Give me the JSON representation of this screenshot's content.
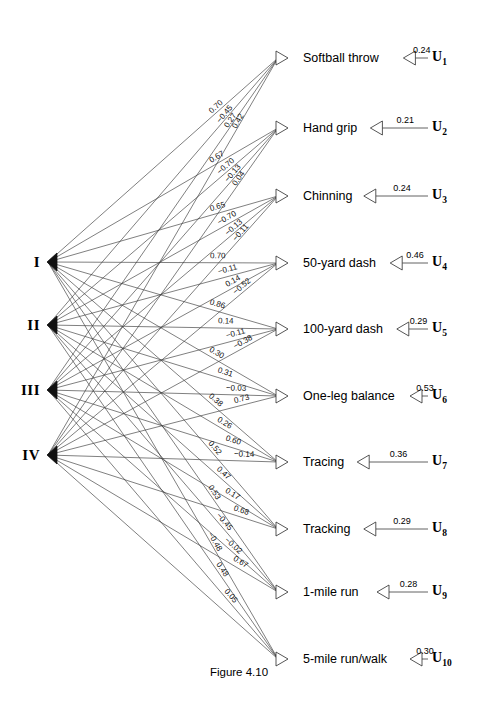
{
  "figure": {
    "caption": "Figure 4.10",
    "type": "path-diagram",
    "title": ""
  },
  "factors": [
    {
      "id": "F1",
      "label": "I",
      "x": 40,
      "y": 262
    },
    {
      "id": "F2",
      "label": "II",
      "x": 40,
      "y": 325
    },
    {
      "id": "F3",
      "label": "III",
      "x": 40,
      "y": 390
    },
    {
      "id": "F4",
      "label": "IV",
      "x": 40,
      "y": 455
    }
  ],
  "variables": [
    {
      "id": "V1",
      "label": "Softball throw",
      "x": 303,
      "y": 58,
      "arrow_x": 288,
      "u": "U",
      "u_sub": "1",
      "u_coef": "0.24",
      "loadings": [
        "0.70",
        "−0.45",
        "0.27",
        "0.42"
      ]
    },
    {
      "id": "V2",
      "label": "Hand grip",
      "x": 303,
      "y": 128,
      "arrow_x": 288,
      "u": "U",
      "u_sub": "2",
      "u_coef": "0.21",
      "loadings": [
        "0.67",
        "−0.70",
        "−0.13",
        "0.04"
      ]
    },
    {
      "id": "V3",
      "label": "Chinning",
      "x": 303,
      "y": 196,
      "arrow_x": 288,
      "u": "U",
      "u_sub": "3",
      "u_coef": "0.24",
      "loadings": [
        "0.65",
        "−0.70",
        "−0.13",
        "−0.11"
      ]
    },
    {
      "id": "V4",
      "label": "50-yard dash",
      "x": 303,
      "y": 263,
      "arrow_x": 288,
      "u": "U",
      "u_sub": "4",
      "u_coef": "0.46",
      "loadings": [
        "0.70",
        "−0.11",
        "0.14",
        "−0.52"
      ]
    },
    {
      "id": "V5",
      "label": "100-yard dash",
      "x": 303,
      "y": 329,
      "arrow_x": 288,
      "u": "U",
      "u_sub": "5",
      "u_coef": "0.29",
      "loadings": [
        "0.86",
        "0.14",
        "−0.11",
        "−0.38"
      ]
    },
    {
      "id": "V6",
      "label": "One-leg balance",
      "x": 303,
      "y": 396,
      "arrow_x": 288,
      "u": "U",
      "u_sub": "6",
      "u_coef": "0.53",
      "loadings": [
        "0.30",
        "0.31",
        "−0.03",
        "0.73"
      ]
    },
    {
      "id": "V7",
      "label": "Tracing",
      "x": 303,
      "y": 462,
      "arrow_x": 288,
      "u": "U",
      "u_sub": "7",
      "u_coef": "0.36",
      "loadings": [
        "0.38",
        "0.26",
        "0.60",
        "−0.14"
      ]
    },
    {
      "id": "V8",
      "label": "Tracking",
      "x": 303,
      "y": 529,
      "arrow_x": 288,
      "u": "U",
      "u_sub": "8",
      "u_coef": "0.29",
      "loadings": [
        "0.52",
        "0.47",
        "0.17",
        "0.68"
      ]
    },
    {
      "id": "V9",
      "label": "1-mile run",
      "x": 303,
      "y": 592,
      "arrow_x": 288,
      "u": "U",
      "u_sub": "9",
      "u_coef": "0.28",
      "loadings": [
        "0.53",
        "−0.45",
        "−0.02",
        "0.67"
      ]
    },
    {
      "id": "V10",
      "label": "5-mile run/walk",
      "x": 303,
      "y": 659,
      "arrow_x": 288,
      "u": "U",
      "u_sub": "10",
      "u_coef": "0.30",
      "loadings": [
        "−0.48",
        "0.48",
        "0.05",
        ""
      ]
    }
  ],
  "chart_data": {
    "type": "diagram",
    "title": "Figure 4.10",
    "factor_names": [
      "I",
      "II",
      "III",
      "IV"
    ],
    "variable_names": [
      "Softball throw",
      "Hand grip",
      "Chinning",
      "50-yard dash",
      "100-yard dash",
      "One-leg balance",
      "Tracing",
      "Tracking",
      "1-mile run",
      "5-mile run/walk"
    ],
    "residual_names": [
      "U1",
      "U2",
      "U3",
      "U4",
      "U5",
      "U6",
      "U7",
      "U8",
      "U9",
      "U10"
    ],
    "residual_coefficients": [
      0.24,
      0.21,
      0.24,
      0.46,
      0.29,
      0.53,
      0.36,
      0.29,
      0.28,
      0.3
    ],
    "loading_labels_by_variable": {
      "Softball throw": [
        "0.70",
        "-0.45",
        "0.27",
        "0.42"
      ],
      "Hand grip": [
        "0.67",
        "-0.70",
        "-0.13",
        "0.04"
      ],
      "Chinning": [
        "0.65",
        "-0.70",
        "-0.13",
        "-0.11"
      ],
      "50-yard dash": [
        "0.70",
        "-0.11",
        "0.14",
        "-0.52"
      ],
      "100-yard dash": [
        "0.86",
        "0.14",
        "-0.11",
        "-0.38"
      ],
      "One-leg balance": [
        "0.30",
        "0.31",
        "-0.03",
        "0.73"
      ],
      "Tracing": [
        "0.38",
        "0.26",
        "0.60",
        "-0.14"
      ],
      "Tracking": [
        "0.52",
        "0.47",
        "0.17",
        "0.68"
      ],
      "1-mile run": [
        "0.53",
        "-0.45",
        "-0.02",
        "0.67"
      ],
      "5-mile run/walk": [
        "-0.48",
        "0.48",
        "0.05"
      ]
    }
  }
}
